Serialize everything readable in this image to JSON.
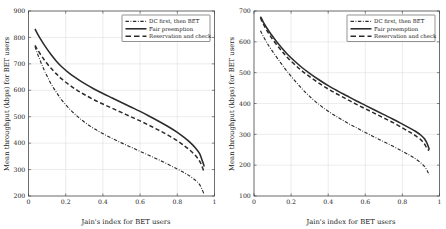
{
  "figure": {
    "panel_count": 2,
    "background": "#ffffff",
    "line_color": "#2b2b2b",
    "grid_color": "#d8d8d8",
    "axis_color": "#3a3a3a"
  },
  "legend": {
    "position": "top-right",
    "boxed": true,
    "entries": [
      {
        "label": "DC first, then BET",
        "style": "dashdot"
      },
      {
        "label": "Fair preemption",
        "style": "solid"
      },
      {
        "label": "Reservation and check",
        "style": "dashed"
      }
    ]
  },
  "chart_data": [
    {
      "type": "line",
      "panel": "left",
      "title": "",
      "xlabel": "Jain's index for BET users",
      "ylabel": "Mean throughput (kbps) for BET users",
      "xlim": [
        0,
        1
      ],
      "ylim": [
        200,
        900
      ],
      "xticks": [
        0,
        0.2,
        0.4,
        0.6,
        0.8,
        1
      ],
      "xticklabels": [
        "0",
        "0.2",
        "0.4",
        "0.6",
        "0.8",
        "1"
      ],
      "yticks": [
        200,
        300,
        400,
        500,
        600,
        700,
        800,
        900
      ],
      "yticklabels": [
        "200",
        "300",
        "400",
        "500",
        "600",
        "700",
        "800",
        "900"
      ],
      "grid": true,
      "legend_position": "top-right",
      "series": [
        {
          "name": "Fair preemption",
          "style": "solid",
          "x": [
            0.035,
            0.05,
            0.07,
            0.09,
            0.12,
            0.15,
            0.18,
            0.22,
            0.26,
            0.3,
            0.35,
            0.4,
            0.45,
            0.5,
            0.55,
            0.6,
            0.65,
            0.7,
            0.75,
            0.8,
            0.84,
            0.87,
            0.9,
            0.92,
            0.935,
            0.945
          ],
          "y": [
            832,
            812,
            788,
            766,
            736,
            710,
            688,
            664,
            644,
            626,
            606,
            588,
            571,
            554,
            537,
            520,
            502,
            483,
            463,
            441,
            420,
            402,
            380,
            360,
            332,
            312
          ]
        },
        {
          "name": "Reservation and check",
          "style": "dashed",
          "x": [
            0.035,
            0.05,
            0.07,
            0.09,
            0.12,
            0.15,
            0.18,
            0.22,
            0.26,
            0.3,
            0.35,
            0.4,
            0.45,
            0.5,
            0.55,
            0.6,
            0.65,
            0.7,
            0.75,
            0.8,
            0.84,
            0.87,
            0.9,
            0.92,
            0.935,
            0.945
          ],
          "y": [
            770,
            752,
            730,
            710,
            684,
            662,
            642,
            620,
            601,
            584,
            565,
            548,
            532,
            516,
            500,
            484,
            467,
            449,
            430,
            409,
            389,
            372,
            351,
            332,
            308,
            288
          ]
        },
        {
          "name": "DC first, then BET",
          "style": "dashdot",
          "x": [
            0.035,
            0.05,
            0.07,
            0.09,
            0.12,
            0.15,
            0.18,
            0.22,
            0.26,
            0.3,
            0.35,
            0.4,
            0.45,
            0.5,
            0.55,
            0.6,
            0.65,
            0.7,
            0.75,
            0.8,
            0.84,
            0.87,
            0.9,
            0.92,
            0.935,
            0.945
          ],
          "y": [
            765,
            735,
            700,
            668,
            626,
            592,
            562,
            530,
            503,
            480,
            456,
            436,
            418,
            401,
            385,
            369,
            353,
            337,
            320,
            302,
            287,
            274,
            258,
            243,
            222,
            205
          ]
        }
      ]
    },
    {
      "type": "line",
      "panel": "right",
      "title": "",
      "xlabel": "Jain's index for BET users",
      "ylabel": "Mean throughput (kbps) for BET users",
      "xlim": [
        0,
        1
      ],
      "ylim": [
        100,
        700
      ],
      "xticks": [
        0,
        0.2,
        0.4,
        0.6,
        0.8,
        1
      ],
      "xticklabels": [
        "0",
        "0.2",
        "0.4",
        "0.6",
        "0.8",
        "1"
      ],
      "yticks": [
        100,
        200,
        300,
        400,
        500,
        600,
        700
      ],
      "yticklabels": [
        "100",
        "200",
        "300",
        "400",
        "500",
        "600",
        "700"
      ],
      "grid": true,
      "legend_position": "top-right",
      "series": [
        {
          "name": "Fair preemption",
          "style": "solid",
          "x": [
            0.035,
            0.05,
            0.07,
            0.09,
            0.12,
            0.15,
            0.18,
            0.22,
            0.26,
            0.3,
            0.35,
            0.4,
            0.45,
            0.5,
            0.55,
            0.6,
            0.65,
            0.7,
            0.75,
            0.8,
            0.84,
            0.87,
            0.9,
            0.92,
            0.935,
            0.945
          ],
          "y": [
            682,
            664,
            644,
            626,
            602,
            580,
            560,
            537,
            516,
            498,
            477,
            458,
            441,
            425,
            409,
            394,
            379,
            364,
            349,
            333,
            320,
            310,
            297,
            285,
            268,
            251
          ]
        },
        {
          "name": "Reservation and check",
          "style": "dashed",
          "x": [
            0.035,
            0.05,
            0.07,
            0.09,
            0.12,
            0.15,
            0.18,
            0.22,
            0.26,
            0.3,
            0.35,
            0.4,
            0.45,
            0.5,
            0.55,
            0.6,
            0.65,
            0.7,
            0.75,
            0.8,
            0.84,
            0.87,
            0.9,
            0.92,
            0.935,
            0.945
          ],
          "y": [
            678,
            658,
            636,
            617,
            592,
            570,
            549,
            526,
            505,
            487,
            466,
            447,
            430,
            414,
            398,
            383,
            368,
            353,
            338,
            321,
            307,
            296,
            282,
            268,
            252,
            248
          ]
        },
        {
          "name": "DC first, then BET",
          "style": "dashdot",
          "x": [
            0.035,
            0.05,
            0.07,
            0.09,
            0.12,
            0.15,
            0.18,
            0.22,
            0.26,
            0.3,
            0.35,
            0.4,
            0.45,
            0.5,
            0.55,
            0.6,
            0.65,
            0.7,
            0.75,
            0.8,
            0.84,
            0.87,
            0.9,
            0.92,
            0.935,
            0.945
          ],
          "y": [
            636,
            618,
            597,
            578,
            552,
            527,
            503,
            474,
            447,
            423,
            397,
            375,
            356,
            338,
            322,
            306,
            291,
            276,
            261,
            245,
            232,
            221,
            207,
            195,
            180,
            168
          ]
        }
      ]
    }
  ]
}
